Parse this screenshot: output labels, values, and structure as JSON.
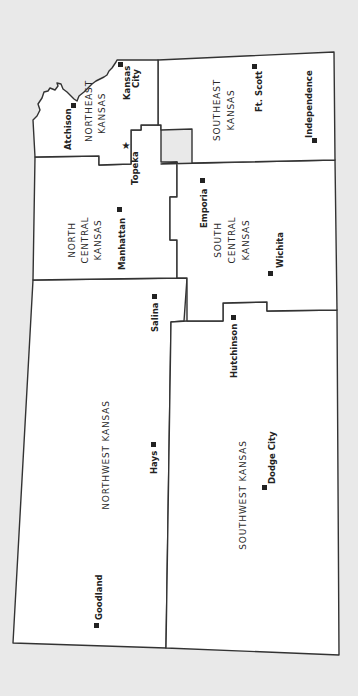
{
  "map": {
    "title": "Kansas Regions",
    "orientation": "rotated 90° clockwise (north faces left)",
    "colors": {
      "background": "#e9e9e9",
      "region_fill": "#ffffff",
      "border": "#333333",
      "text": "#222222"
    },
    "regions": [
      {
        "id": "northeast",
        "label_line1": "NORTHEAST",
        "label_line2": "KANSAS"
      },
      {
        "id": "north-central",
        "label_line1": "NORTH",
        "label_line2": "CENTRAL",
        "label_line3": "KANSAS"
      },
      {
        "id": "southeast",
        "label_line1": "SOUTHEAST",
        "label_line2": "KANSAS"
      },
      {
        "id": "south-central",
        "label_line1": "SOUTH",
        "label_line2": "CENTRAL",
        "label_line3": "KANSAS"
      },
      {
        "id": "northwest",
        "label_line1": "NORTHWEST KANSAS"
      },
      {
        "id": "southwest",
        "label_line1": "SOUTHWEST KANSAS"
      }
    ],
    "cities": [
      {
        "name": "Kansas City",
        "line1": "Kansas",
        "line2": "City",
        "marker": "square",
        "region": "northeast"
      },
      {
        "name": "Atchison",
        "marker": "square",
        "region": "northeast"
      },
      {
        "name": "Topeka",
        "marker": "star",
        "capital": true,
        "region": "northeast"
      },
      {
        "name": "Manhattan",
        "marker": "square",
        "region": "north-central"
      },
      {
        "name": "Ft. Scott",
        "marker": "square",
        "region": "southeast"
      },
      {
        "name": "Independence",
        "marker": "square",
        "region": "southeast"
      },
      {
        "name": "Emporia",
        "marker": "square",
        "region": "south-central"
      },
      {
        "name": "Wichita",
        "marker": "square",
        "region": "south-central"
      },
      {
        "name": "Salina",
        "marker": "square",
        "region": "northwest"
      },
      {
        "name": "Hutchinson",
        "marker": "square",
        "region": "south-central"
      },
      {
        "name": "Hays",
        "marker": "square",
        "region": "northwest"
      },
      {
        "name": "Dodge City",
        "marker": "square",
        "region": "southwest"
      },
      {
        "name": "Goodland",
        "marker": "square",
        "region": "northwest"
      }
    ],
    "legend": {
      "square": "city",
      "star": "state capital"
    }
  }
}
